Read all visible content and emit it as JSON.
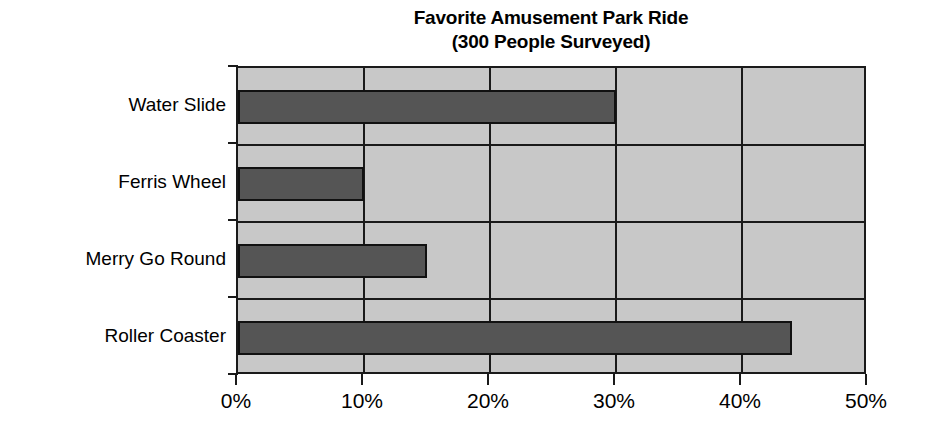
{
  "chart_data": {
    "type": "bar",
    "orientation": "horizontal",
    "title": "Favorite Amusement Park Ride",
    "subtitle": "(300 People Surveyed)",
    "title_lines": [
      "Favorite Amusement Park Ride",
      "(300 People Surveyed)"
    ],
    "categories": [
      "Water Slide",
      "Ferris Wheel",
      "Merry Go Round",
      "Roller Coaster"
    ],
    "values": [
      30,
      10,
      15,
      44
    ],
    "xlabel": "",
    "ylabel": "",
    "xlim": [
      0,
      50
    ],
    "xticks": [
      0,
      10,
      20,
      30,
      40,
      50
    ],
    "xtick_labels": [
      "0%",
      "10%",
      "20%",
      "30%",
      "40%",
      "50%"
    ],
    "value_unit": "%",
    "grid": true,
    "legend": false,
    "colors": {
      "bar_fill": "#555555",
      "bar_edge": "#111111",
      "plot_background": "#c8c8c8",
      "axis": "#1a1a1a",
      "text": "#000000",
      "page_background": "#ffffff"
    }
  }
}
